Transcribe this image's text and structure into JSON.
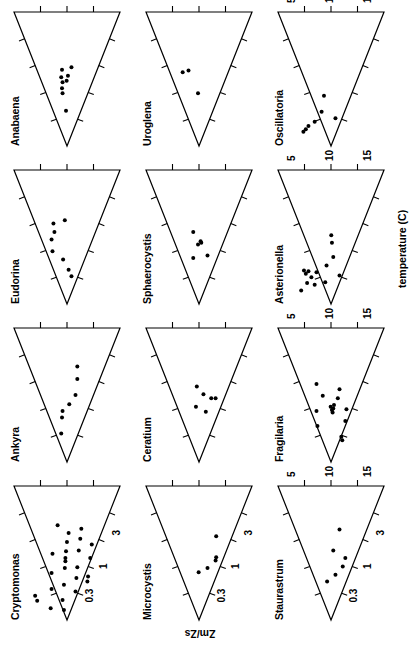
{
  "figure": {
    "kind": "small-multiples-scatter-grid",
    "rows": 3,
    "cols": 4,
    "rotation_note": "page rendered sideways",
    "ink_color": "#000000",
    "background_color": "#ffffff"
  },
  "axes": {
    "x_title": "temperature (C)",
    "y_title": "Zm/Zs",
    "x_ticks": [
      5,
      10,
      15
    ],
    "x_tick_labels": [
      "5",
      "10",
      "15"
    ],
    "x_range": [
      2,
      18
    ],
    "y_ticks": [
      0.3,
      1,
      3
    ],
    "y_tick_labels": [
      "0.3",
      "1",
      "3"
    ],
    "y_range": [
      0.12,
      6.0
    ],
    "y_scale": "log",
    "x_scale": "linear",
    "minor_ticks_per_edge": 4
  },
  "chart_data": {
    "type": "scatter",
    "title": "",
    "xlabel": "temperature (C)",
    "ylabel": "Zm/Zs",
    "xlim": [
      2,
      18
    ],
    "ylim": [
      0.12,
      6.0
    ],
    "yscale": "log",
    "xticks": [
      5,
      10,
      15
    ],
    "yticks": [
      0.3,
      1,
      3
    ],
    "grid": false,
    "legend": "none",
    "marker": "filled-circle",
    "envelope": "triangular habitat boundary drawn on each panel",
    "panels": [
      {
        "name": "Cryptomonas",
        "row": 0,
        "col": 0,
        "n": 26,
        "points": [
          {
            "x": 4.3,
            "y": 2.55
          },
          {
            "x": 4.9,
            "y": 2.75
          },
          {
            "x": 3.4,
            "y": 1.55
          },
          {
            "x": 5.7,
            "y": 1.5
          },
          {
            "x": 7.6,
            "y": 1.5
          },
          {
            "x": 9.9,
            "y": 1.45
          },
          {
            "x": 4.4,
            "y": 1.0
          },
          {
            "x": 6.2,
            "y": 0.95
          },
          {
            "x": 8.2,
            "y": 0.92
          },
          {
            "x": 9.0,
            "y": 0.9
          },
          {
            "x": 9.4,
            "y": 0.9
          },
          {
            "x": 10.2,
            "y": 0.88
          },
          {
            "x": 11.3,
            "y": 0.85
          },
          {
            "x": 12.4,
            "y": 0.8
          },
          {
            "x": 5.4,
            "y": 0.62
          },
          {
            "x": 7.0,
            "y": 0.6
          },
          {
            "x": 8.3,
            "y": 0.58
          },
          {
            "x": 10.3,
            "y": 0.55
          },
          {
            "x": 11.7,
            "y": 0.52
          },
          {
            "x": 12.9,
            "y": 0.5
          },
          {
            "x": 6.6,
            "y": 0.4
          },
          {
            "x": 7.2,
            "y": 0.39
          },
          {
            "x": 9.4,
            "y": 0.36
          },
          {
            "x": 11.0,
            "y": 0.34
          },
          {
            "x": 3.2,
            "y": 0.95
          },
          {
            "x": 13.3,
            "y": 1.2
          }
        ]
      },
      {
        "name": "Ankyra",
        "row": 0,
        "col": 1,
        "n": 7,
        "points": [
          {
            "x": 5.4,
            "y": 1.05
          },
          {
            "x": 7.3,
            "y": 1.02
          },
          {
            "x": 8.1,
            "y": 1.0
          },
          {
            "x": 8.9,
            "y": 0.78
          },
          {
            "x": 10.0,
            "y": 0.62
          },
          {
            "x": 11.9,
            "y": 0.58
          },
          {
            "x": 13.4,
            "y": 0.58
          }
        ]
      },
      {
        "name": "Eudorina",
        "row": 0,
        "col": 2,
        "n": 8,
        "points": [
          {
            "x": 8.3,
            "y": 1.45
          },
          {
            "x": 9.7,
            "y": 1.5
          },
          {
            "x": 10.6,
            "y": 1.35
          },
          {
            "x": 11.6,
            "y": 1.4
          },
          {
            "x": 7.3,
            "y": 0.98
          },
          {
            "x": 12.0,
            "y": 0.92
          },
          {
            "x": 5.3,
            "y": 0.72
          },
          {
            "x": 6.1,
            "y": 0.8
          }
        ]
      },
      {
        "name": "Anabaena",
        "row": 0,
        "col": 3,
        "n": 9,
        "points": [
          {
            "x": 6.2,
            "y": 0.88
          },
          {
            "x": 8.3,
            "y": 1.0
          },
          {
            "x": 8.9,
            "y": 1.02
          },
          {
            "x": 9.6,
            "y": 1.0
          },
          {
            "x": 10.2,
            "y": 1.05
          },
          {
            "x": 10.4,
            "y": 0.82
          },
          {
            "x": 11.1,
            "y": 1.02
          },
          {
            "x": 11.4,
            "y": 0.72
          },
          {
            "x": 9.8,
            "y": 0.86
          }
        ]
      },
      {
        "name": "Microcystis",
        "row": 1,
        "col": 0,
        "n": 5,
        "points": [
          {
            "x": 7.7,
            "y": 0.86
          },
          {
            "x": 8.2,
            "y": 0.62
          },
          {
            "x": 9.1,
            "y": 0.46
          },
          {
            "x": 9.5,
            "y": 0.45
          },
          {
            "x": 12.0,
            "y": 0.45
          }
        ]
      },
      {
        "name": "Ceratium",
        "row": 1,
        "col": 1,
        "n": 6,
        "points": [
          {
            "x": 8.6,
            "y": 0.95
          },
          {
            "x": 11.0,
            "y": 0.92
          },
          {
            "x": 10.1,
            "y": 0.72
          },
          {
            "x": 9.6,
            "y": 0.54
          },
          {
            "x": 9.6,
            "y": 0.46
          },
          {
            "x": 8.0,
            "y": 0.66
          }
        ]
      },
      {
        "name": "Sphaerocystis",
        "row": 1,
        "col": 2,
        "n": 6,
        "points": [
          {
            "x": 7.5,
            "y": 1.05
          },
          {
            "x": 10.6,
            "y": 1.05
          },
          {
            "x": 9.1,
            "y": 0.88
          },
          {
            "x": 9.5,
            "y": 0.8
          },
          {
            "x": 9.3,
            "y": 0.78
          },
          {
            "x": 7.8,
            "y": 0.62
          }
        ]
      },
      {
        "name": "Uroglena",
        "row": 1,
        "col": 3,
        "n": 3,
        "points": [
          {
            "x": 10.8,
            "y": 1.55
          },
          {
            "x": 11.0,
            "y": 1.25
          },
          {
            "x": 8.3,
            "y": 0.88
          }
        ]
      },
      {
        "name": "Staurastrum",
        "row": 2,
        "col": 0,
        "n": 6,
        "points": [
          {
            "x": 6.6,
            "y": 0.98
          },
          {
            "x": 7.4,
            "y": 0.72
          },
          {
            "x": 8.4,
            "y": 0.55
          },
          {
            "x": 9.4,
            "y": 0.5
          },
          {
            "x": 10.3,
            "y": 0.78
          },
          {
            "x": 12.8,
            "y": 0.62
          }
        ]
      },
      {
        "name": "Fragilaria",
        "row": 2,
        "col": 1,
        "n": 15,
        "points": [
          {
            "x": 6.3,
            "y": 1.4
          },
          {
            "x": 8.1,
            "y": 1.45
          },
          {
            "x": 11.3,
            "y": 1.45
          },
          {
            "x": 9.9,
            "y": 1.15
          },
          {
            "x": 7.9,
            "y": 0.8
          },
          {
            "x": 8.2,
            "y": 0.82
          },
          {
            "x": 8.4,
            "y": 0.78
          },
          {
            "x": 8.6,
            "y": 0.86
          },
          {
            "x": 8.8,
            "y": 0.76
          },
          {
            "x": 9.6,
            "y": 0.66
          },
          {
            "x": 10.7,
            "y": 0.62
          },
          {
            "x": 4.6,
            "y": 0.56
          },
          {
            "x": 5.0,
            "y": 0.58
          },
          {
            "x": 6.9,
            "y": 0.5
          },
          {
            "x": 8.3,
            "y": 0.48
          }
        ]
      },
      {
        "name": "Asterionella",
        "row": 2,
        "col": 2,
        "n": 14,
        "points": [
          {
            "x": 3.6,
            "y": 2.55
          },
          {
            "x": 4.5,
            "y": 2.05
          },
          {
            "x": 5.6,
            "y": 2.15
          },
          {
            "x": 5.9,
            "y": 1.95
          },
          {
            "x": 4.3,
            "y": 1.55
          },
          {
            "x": 5.8,
            "y": 1.45
          },
          {
            "x": 4.6,
            "y": 1.05
          },
          {
            "x": 6.6,
            "y": 1.0
          },
          {
            "x": 9.3,
            "y": 0.82
          },
          {
            "x": 10.2,
            "y": 0.84
          },
          {
            "x": 7.6,
            "y": 0.78
          },
          {
            "x": 5.4,
            "y": 0.62
          },
          {
            "x": 6.0,
            "y": 2.3
          },
          {
            "x": 5.2,
            "y": 1.75
          }
        ]
      },
      {
        "name": "Oscillatoria",
        "row": 2,
        "col": 3,
        "n": 7,
        "points": [
          {
            "x": 3.7,
            "y": 2.35
          },
          {
            "x": 4.4,
            "y": 1.95
          },
          {
            "x": 4.9,
            "y": 1.55
          },
          {
            "x": 6.1,
            "y": 1.2
          },
          {
            "x": 8.0,
            "y": 1.1
          },
          {
            "x": 5.3,
            "y": 0.72
          },
          {
            "x": 4.0,
            "y": 2.15
          }
        ]
      }
    ]
  },
  "panel_titles": [
    "Cryptomonas",
    "Ankyra",
    "Eudorina",
    "Anabaena",
    "Microcystis",
    "Ceratium",
    "Sphaerocystis",
    "Uroglena",
    "Staurastrum",
    "Fragilaria",
    "Asterionella",
    "Oscillatoria"
  ]
}
